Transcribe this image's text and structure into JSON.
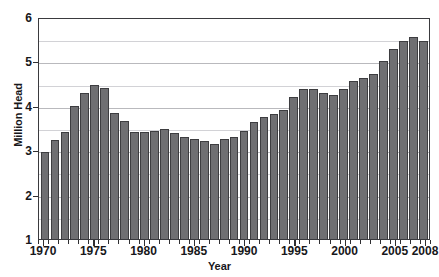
{
  "figure": {
    "title_cropped": "",
    "background_color": "#ffffff",
    "bar_color": "#6f6f72",
    "bar_edge_color": "#3d3d40",
    "axis_color": "#3a3a3e",
    "gridline_color": "#b9b9bd"
  },
  "axes": {
    "ylabel": "Million Head",
    "xlabel": "Year",
    "ytick_labels": [
      "6",
      "5",
      "4",
      "3",
      "2",
      "1"
    ],
    "xtick_labels": [
      "1970",
      "1975",
      "1980",
      "1985",
      "1990",
      "1995",
      "2000",
      "2005",
      "2008"
    ]
  },
  "chart_data": {
    "type": "bar",
    "title": "",
    "xlabel": "Year",
    "ylabel": "Million Head",
    "ylim": [
      1,
      6
    ],
    "ytick_values": [
      1,
      2,
      3,
      4,
      5,
      6
    ],
    "gridlines_major": [
      1,
      2,
      3,
      4,
      5,
      6
    ],
    "gridlines_minor": [
      1.5,
      2.5,
      3.5,
      4.5,
      5.5
    ],
    "grid": true,
    "legend": null,
    "xtick_years": [
      1970,
      1975,
      1980,
      1985,
      1990,
      1995,
      2000,
      2005,
      2008
    ],
    "categories": [
      "1970",
      "1971",
      "1972",
      "1973",
      "1974",
      "1975",
      "1976",
      "1977",
      "1978",
      "1979",
      "1980",
      "1981",
      "1982",
      "1983",
      "1984",
      "1985",
      "1986",
      "1987",
      "1988",
      "1989",
      "1990",
      "1991",
      "1992",
      "1993",
      "1994",
      "1995",
      "1996",
      "1997",
      "1998",
      "1999",
      "2000",
      "2001",
      "2002",
      "2003",
      "2004",
      "2005",
      "2006",
      "2007",
      "2008"
    ],
    "values": [
      2.95,
      3.22,
      3.42,
      3.99,
      4.3,
      4.47,
      4.4,
      3.83,
      3.67,
      3.41,
      3.41,
      3.44,
      3.48,
      3.39,
      3.3,
      3.25,
      3.2,
      3.15,
      3.25,
      3.29,
      3.44,
      3.63,
      3.74,
      3.82,
      3.91,
      4.21,
      4.39,
      4.39,
      4.3,
      4.25,
      4.39,
      4.57,
      4.62,
      4.72,
      5.0,
      5.28,
      5.46,
      5.55,
      5.47
    ]
  }
}
